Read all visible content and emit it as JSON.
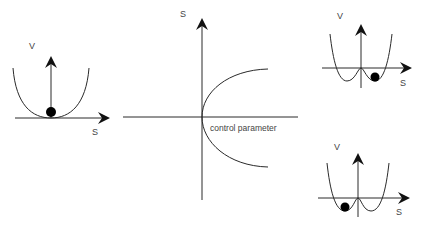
{
  "colors": {
    "stroke": "#2a2a2a",
    "text": "#444444",
    "ball": "#000000",
    "background": "#ffffff"
  },
  "panels": {
    "left": {
      "title": "single-well potential",
      "y_label": "V",
      "x_label": "S",
      "ball": "at minimum (S = 0)"
    },
    "center": {
      "title": "pitchfork bifurcation",
      "y_label": "S",
      "x_label": "control parameter"
    },
    "top_right": {
      "title": "double-well potential, ball in right well",
      "y_label": "V",
      "x_label": "S"
    },
    "bottom_right": {
      "title": "double-well potential, ball in left well",
      "y_label": "V",
      "x_label": "S"
    }
  }
}
